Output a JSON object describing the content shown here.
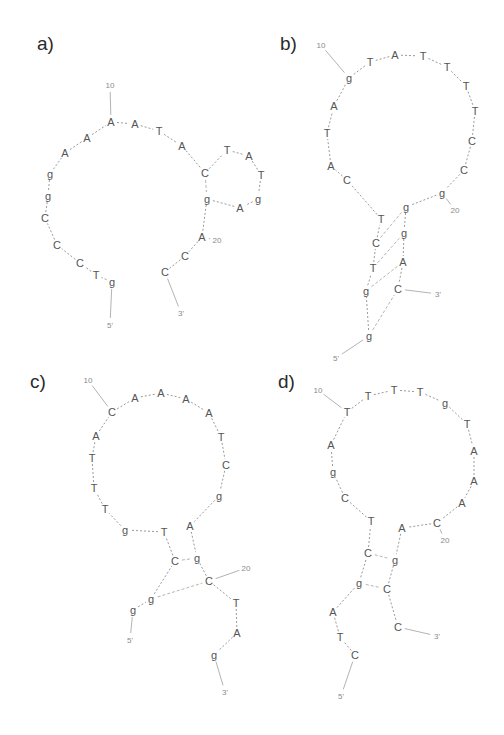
{
  "figure": {
    "type": "DNA hairpin secondary structures",
    "panels": [
      {
        "label": "a)",
        "nucleotides": [
          {
            "b": "g",
            "x": 112,
            "y": 282
          },
          {
            "b": "T",
            "x": 96,
            "y": 275
          },
          {
            "b": "C",
            "x": 80,
            "y": 263
          },
          {
            "b": "C",
            "x": 57,
            "y": 245
          },
          {
            "b": "C",
            "x": 45,
            "y": 218
          },
          {
            "b": "g",
            "x": 48,
            "y": 196
          },
          {
            "b": "g",
            "x": 50,
            "y": 174
          },
          {
            "b": "A",
            "x": 65,
            "y": 153
          },
          {
            "b": "A",
            "x": 87,
            "y": 138
          },
          {
            "b": "A",
            "x": 111,
            "y": 122
          },
          {
            "b": "A",
            "x": 135,
            "y": 124
          },
          {
            "b": "T",
            "x": 159,
            "y": 131
          },
          {
            "b": "A",
            "x": 182,
            "y": 146
          },
          {
            "b": "C",
            "x": 205,
            "y": 173
          },
          {
            "b": "T",
            "x": 227,
            "y": 150
          },
          {
            "b": "A",
            "x": 249,
            "y": 156
          },
          {
            "b": "T",
            "x": 261,
            "y": 175
          },
          {
            "b": "g",
            "x": 258,
            "y": 199
          },
          {
            "b": "A",
            "x": 240,
            "y": 208
          },
          {
            "b": "g",
            "x": 207,
            "y": 199
          },
          {
            "b": "A",
            "x": 202,
            "y": 237
          },
          {
            "b": "C",
            "x": 185,
            "y": 256
          },
          {
            "b": "C",
            "x": 165,
            "y": 272
          }
        ],
        "numbers": [
          {
            "t": "10",
            "x": 110,
            "y": 85
          },
          {
            "t": "20",
            "x": 217,
            "y": 240
          },
          {
            "t": "5'",
            "x": 110,
            "y": 325
          },
          {
            "t": "3'",
            "x": 181,
            "y": 313
          }
        ]
      },
      {
        "label": "b)",
        "nucleotides": [
          {
            "b": "g",
            "x": 369,
            "y": 336
          },
          {
            "b": "g",
            "x": 366,
            "y": 291
          },
          {
            "b": "T",
            "x": 373,
            "y": 268
          },
          {
            "b": "C",
            "x": 376,
            "y": 243
          },
          {
            "b": "T",
            "x": 381,
            "y": 219
          },
          {
            "b": "C",
            "x": 347,
            "y": 180
          },
          {
            "b": "A",
            "x": 331,
            "y": 166
          },
          {
            "b": "T",
            "x": 327,
            "y": 133
          },
          {
            "b": "A",
            "x": 334,
            "y": 106
          },
          {
            "b": "g",
            "x": 349,
            "y": 78
          },
          {
            "b": "T",
            "x": 370,
            "y": 62
          },
          {
            "b": "A",
            "x": 395,
            "y": 55
          },
          {
            "b": "T",
            "x": 423,
            "y": 56
          },
          {
            "b": "T",
            "x": 447,
            "y": 67
          },
          {
            "b": "T",
            "x": 466,
            "y": 86
          },
          {
            "b": "T",
            "x": 475,
            "y": 111
          },
          {
            "b": "C",
            "x": 472,
            "y": 141
          },
          {
            "b": "C",
            "x": 464,
            "y": 170
          },
          {
            "b": "g",
            "x": 442,
            "y": 193
          },
          {
            "b": "g",
            "x": 406,
            "y": 207
          },
          {
            "b": "g",
            "x": 404,
            "y": 233
          },
          {
            "b": "A",
            "x": 403,
            "y": 262
          },
          {
            "b": "C",
            "x": 398,
            "y": 289
          }
        ],
        "numbers": [
          {
            "t": "10",
            "x": 321,
            "y": 45
          },
          {
            "t": "20",
            "x": 455,
            "y": 210
          },
          {
            "t": "5'",
            "x": 336,
            "y": 358
          },
          {
            "t": "3'",
            "x": 438,
            "y": 294
          }
        ]
      },
      {
        "label": "c)",
        "nucleotides": [
          {
            "b": "g",
            "x": 133,
            "y": 610
          },
          {
            "b": "g",
            "x": 151,
            "y": 599
          },
          {
            "b": "C",
            "x": 175,
            "y": 561
          },
          {
            "b": "T",
            "x": 164,
            "y": 532
          },
          {
            "b": "g",
            "x": 125,
            "y": 530
          },
          {
            "b": "T",
            "x": 105,
            "y": 509
          },
          {
            "b": "T",
            "x": 94,
            "y": 488
          },
          {
            "b": "T",
            "x": 92,
            "y": 458
          },
          {
            "b": "A",
            "x": 96,
            "y": 436
          },
          {
            "b": "C",
            "x": 112,
            "y": 412
          },
          {
            "b": "A",
            "x": 135,
            "y": 398
          },
          {
            "b": "A",
            "x": 161,
            "y": 393
          },
          {
            "b": "A",
            "x": 186,
            "y": 399
          },
          {
            "b": "A",
            "x": 209,
            "y": 413
          },
          {
            "b": "T",
            "x": 221,
            "y": 437
          },
          {
            "b": "C",
            "x": 226,
            "y": 465
          },
          {
            "b": "g",
            "x": 219,
            "y": 496
          },
          {
            "b": "A",
            "x": 190,
            "y": 526
          },
          {
            "b": "g",
            "x": 197,
            "y": 558
          },
          {
            "b": "C",
            "x": 209,
            "y": 581
          },
          {
            "b": "T",
            "x": 236,
            "y": 603
          },
          {
            "b": "A",
            "x": 237,
            "y": 633
          },
          {
            "b": "g",
            "x": 214,
            "y": 655
          }
        ],
        "numbers": [
          {
            "t": "10",
            "x": 88,
            "y": 380
          },
          {
            "t": "20",
            "x": 246,
            "y": 568
          },
          {
            "t": "5'",
            "x": 130,
            "y": 640
          },
          {
            "t": "3'",
            "x": 225,
            "y": 692
          }
        ]
      },
      {
        "label": "d)",
        "nucleotides": [
          {
            "b": "C",
            "x": 355,
            "y": 655
          },
          {
            "b": "T",
            "x": 340,
            "y": 637
          },
          {
            "b": "A",
            "x": 333,
            "y": 612
          },
          {
            "b": "g",
            "x": 359,
            "y": 583
          },
          {
            "b": "C",
            "x": 368,
            "y": 553
          },
          {
            "b": "T",
            "x": 371,
            "y": 521
          },
          {
            "b": "C",
            "x": 345,
            "y": 498
          },
          {
            "b": "g",
            "x": 333,
            "y": 472
          },
          {
            "b": "A",
            "x": 331,
            "y": 445
          },
          {
            "b": "T",
            "x": 347,
            "y": 412
          },
          {
            "b": "T",
            "x": 368,
            "y": 396
          },
          {
            "b": "T",
            "x": 394,
            "y": 390
          },
          {
            "b": "T",
            "x": 420,
            "y": 392
          },
          {
            "b": "g",
            "x": 445,
            "y": 403
          },
          {
            "b": "T",
            "x": 467,
            "y": 424
          },
          {
            "b": "A",
            "x": 474,
            "y": 451
          },
          {
            "b": "A",
            "x": 474,
            "y": 481
          },
          {
            "b": "A",
            "x": 462,
            "y": 503
          },
          {
            "b": "C",
            "x": 437,
            "y": 523
          },
          {
            "b": "A",
            "x": 402,
            "y": 528
          },
          {
            "b": "g",
            "x": 395,
            "y": 560
          },
          {
            "b": "C",
            "x": 387,
            "y": 589
          },
          {
            "b": "C",
            "x": 398,
            "y": 627
          }
        ],
        "numbers": [
          {
            "t": "10",
            "x": 318,
            "y": 390
          },
          {
            "t": "20",
            "x": 445,
            "y": 540
          },
          {
            "t": "5'",
            "x": 341,
            "y": 696
          },
          {
            "t": "3'",
            "x": 437,
            "y": 636
          }
        ]
      }
    ]
  },
  "panel_labels": {
    "a": "a)",
    "b": "b)",
    "c": "c)",
    "d": "d)"
  },
  "colors": {
    "text": "#555555",
    "label": "#2a2a2a",
    "background": "#ffffff"
  }
}
